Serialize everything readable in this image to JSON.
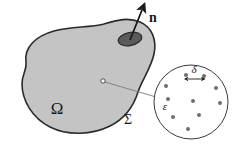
{
  "figure": {
    "background_color": "#ffffff",
    "domain": {
      "name": "Omega",
      "label": "Ω",
      "label_x": 57,
      "label_y": 114,
      "fill_color": "#c4c4c4",
      "stroke_color": "#2b2b2b",
      "stroke_width": 1.6,
      "outline_path": "M 26 62 C 24 47 36 36 54 31 C 72 26 88 28 104 24 C 118 20 128 17 140 22 C 152 27 157 40 154 54 C 151 68 142 80 138 92 C 134 105 126 118 110 126 C 92 135 68 136 50 127 C 32 118 22 100 22 84 C 22 74 27 70 26 62 Z"
    },
    "boundary": {
      "name": "Sigma",
      "label": "Σ",
      "label_x": 128,
      "label_y": 124
    },
    "normal_vector": {
      "name": "n",
      "label": "n",
      "label_x": 149,
      "label_y": 22,
      "tail_x": 130,
      "tail_y": 40,
      "tip_x": 142,
      "tip_y": 10,
      "stroke_color": "#1a1a1a",
      "stroke_width": 1.8
    },
    "surface_patch": {
      "name": "surface-element",
      "center_x": 130,
      "center_y": 39,
      "radius_x": 12,
      "radius_y": 6.5,
      "rotation_deg": -12,
      "fill_color": "#5a5a5a",
      "stroke_color": "#2b2b2b"
    },
    "interior_point": {
      "name": "interior-point",
      "center_x": 103,
      "center_y": 81,
      "radius": 2.2,
      "fill_color": "#ffffff",
      "stroke_color": "#3a3a3a"
    },
    "connector": {
      "name": "magnifier-connector",
      "from_x": 105,
      "from_y": 82,
      "to_x": 156,
      "to_y": 97,
      "stroke_color": "#7a7a7a",
      "stroke_width": 0.9
    },
    "inset": {
      "name": "magnified-cell",
      "center_x": 191,
      "center_y": 102,
      "radius": 37,
      "fill_color": "#ffffff",
      "stroke_color": "#3a3a3a",
      "stroke_width": 1.0,
      "particle_color": "#6e6e6e",
      "particle_radius": 2.0,
      "particles": [
        {
          "x": 186,
          "y": 75
        },
        {
          "x": 204,
          "y": 76
        },
        {
          "x": 166,
          "y": 86
        },
        {
          "x": 216,
          "y": 88
        },
        {
          "x": 168,
          "y": 99
        },
        {
          "x": 193,
          "y": 101
        },
        {
          "x": 220,
          "y": 103
        },
        {
          "x": 173,
          "y": 117
        },
        {
          "x": 199,
          "y": 115
        },
        {
          "x": 188,
          "y": 129
        }
      ],
      "spacing_label": {
        "name": "delta",
        "label": "δ",
        "label_x": 194,
        "label_y": 73,
        "arrow_left_x": 187,
        "arrow_right_x": 203,
        "arrow_y": 79,
        "stroke_color": "#1a1a1a"
      },
      "size_label": {
        "name": "epsilon",
        "label": "ε",
        "label_x": 165,
        "label_y": 110,
        "marker_x": 168,
        "marker_y": 99
      }
    }
  }
}
